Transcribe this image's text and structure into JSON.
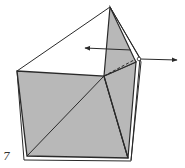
{
  "diagram": {
    "type": "origami-fold-step",
    "step_number": "7",
    "colors": {
      "paper_fill": "#b8b8b8",
      "stroke": "#2a2a2a",
      "background": "#ffffff"
    },
    "arrows": [
      {
        "name": "pull-left-arrow",
        "direction": "left"
      },
      {
        "name": "pull-right-arrow",
        "direction": "right"
      }
    ],
    "lines": {
      "dashed_fold": "hidden edge",
      "diagonals": 2
    }
  }
}
